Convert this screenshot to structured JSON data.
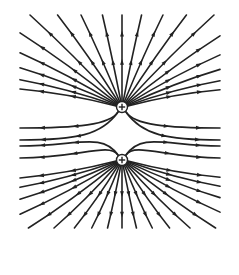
{
  "diagram": {
    "title": "Electric field lines of two equal positive charges",
    "stroke_color": "#222222",
    "background": "#ffffff",
    "charges": [
      {
        "id": "top",
        "sign": "+",
        "x": 122,
        "y": 107,
        "r": 5.5
      },
      {
        "id": "bottom",
        "sign": "+",
        "x": 122,
        "y": 160,
        "r": 5.5
      }
    ],
    "arrow_direction": "outward",
    "lines": {
      "top_radial_angles_deg": [
        -90,
        -78,
        -66,
        -55,
        -45,
        -36,
        -28,
        -21,
        -15,
        -10,
        258,
        246,
        235,
        225,
        216,
        208,
        201,
        195,
        190
      ],
      "bottom_radial_angles_deg": [
        90,
        78,
        66,
        55,
        45,
        36,
        28,
        21,
        15,
        10,
        102,
        114,
        125,
        135,
        144,
        152,
        159,
        165,
        170
      ],
      "top_side_curves_y_end": [
        128,
        140
      ],
      "bottom_side_curves_y_end": [
        146,
        158
      ]
    }
  }
}
